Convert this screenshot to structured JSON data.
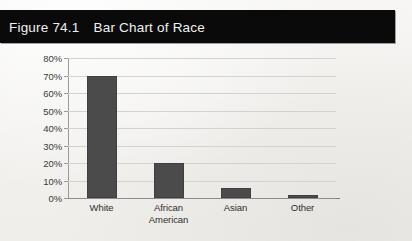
{
  "figure": {
    "number": "Figure 74.1",
    "caption": "Bar Chart of Race",
    "header_background": "#0a0a0a",
    "header_text_color": "#f0f0f0"
  },
  "colors": {
    "bar_fill": "#4b4b4b",
    "gridline": "#d2d2d0",
    "axis": "#9a9a98",
    "page_background": "#f4f3f1"
  },
  "chart_data": {
    "type": "bar",
    "title": "Bar Chart of Race",
    "xlabel": "",
    "ylabel": "",
    "categories": [
      "White",
      "African\nAmerican",
      "Asian",
      "Other"
    ],
    "values": [
      70,
      20,
      5.5,
      2
    ],
    "ylim": [
      0,
      80
    ],
    "yticks": [
      0,
      10,
      20,
      30,
      40,
      50,
      60,
      70,
      80
    ],
    "ytick_labels": [
      "0%",
      "10%",
      "20%",
      "30%",
      "40%",
      "50%",
      "60%",
      "70%",
      "80%"
    ],
    "grid": true,
    "legend": false,
    "legend_position": "none",
    "bar_color": "#4b4b4b"
  }
}
